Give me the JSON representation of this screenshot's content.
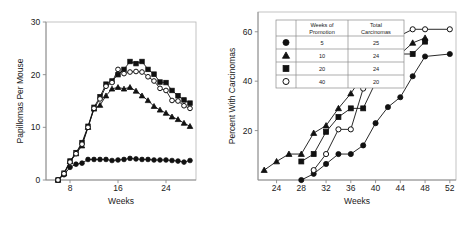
{
  "figure": {
    "background": "#ffffff",
    "ink_color": "#111111",
    "axis_color": "#8a8a8a"
  },
  "chart_data": [
    {
      "id": "papillomas-chart",
      "type": "line",
      "title": "",
      "xlabel": "Weeks",
      "ylabel": "Papillomas Per Mouse",
      "xlim": [
        4,
        29
      ],
      "ylim": [
        0,
        30
      ],
      "xticks": [
        8,
        16,
        24
      ],
      "xtick_labels": [
        "8",
        "16",
        "24"
      ],
      "yticks": [
        0,
        10,
        20,
        30
      ],
      "ytick_labels": [
        "0",
        "10",
        "20",
        "30"
      ],
      "grid": false,
      "legend_position": "none",
      "series": [
        {
          "name": "5",
          "marker": "filled-circle",
          "x": [
            6,
            7,
            8,
            9,
            10,
            11,
            12,
            13,
            14,
            15,
            16,
            17,
            18,
            19,
            20,
            21,
            22,
            23,
            24,
            25,
            26,
            27,
            28
          ],
          "y": [
            0,
            1.0,
            2.4,
            3.0,
            3.2,
            3.9,
            3.9,
            3.9,
            3.9,
            3.7,
            3.8,
            3.9,
            4.1,
            4.0,
            3.9,
            3.9,
            3.8,
            3.8,
            3.8,
            3.7,
            3.6,
            3.4,
            3.7
          ]
        },
        {
          "name": "10",
          "marker": "filled-triangle",
          "x": [
            6,
            7,
            8,
            9,
            10,
            11,
            12,
            13,
            14,
            15,
            16,
            17,
            18,
            19,
            20,
            21,
            22,
            23,
            24,
            25,
            26,
            27,
            28
          ],
          "y": [
            0,
            1.2,
            3.5,
            5.0,
            6.5,
            10.0,
            13.5,
            14.2,
            16.0,
            17.3,
            17.6,
            17.3,
            17.6,
            16.9,
            16.0,
            15.1,
            14.0,
            13.3,
            12.7,
            12.0,
            11.5,
            10.8,
            10.2
          ]
        },
        {
          "name": "20",
          "marker": "filled-square",
          "x": [
            6,
            7,
            8,
            9,
            10,
            11,
            12,
            13,
            14,
            15,
            16,
            17,
            18,
            19,
            20,
            21,
            22,
            23,
            24,
            25,
            26,
            27,
            28
          ],
          "y": [
            0,
            1.3,
            3.6,
            5.2,
            7.1,
            10.2,
            13.8,
            15.8,
            18.2,
            18.8,
            20.0,
            21.0,
            22.5,
            22.1,
            22.5,
            21.0,
            20.1,
            18.6,
            18.5,
            17.0,
            16.0,
            15.2,
            14.6
          ]
        },
        {
          "name": "40",
          "marker": "open-circle",
          "x": [
            6,
            7,
            8,
            9,
            10,
            11,
            12,
            13,
            14,
            15,
            16,
            17,
            18,
            19,
            20,
            21,
            22,
            23,
            24,
            25,
            26,
            27,
            28
          ],
          "y": [
            0,
            1.2,
            3.4,
            5.0,
            6.8,
            10.0,
            13.6,
            15.4,
            17.8,
            18.5,
            21.0,
            20.2,
            20.5,
            20.6,
            20.5,
            19.6,
            18.8,
            17.4,
            17.0,
            15.1,
            15.0,
            14.1,
            13.6
          ]
        }
      ]
    },
    {
      "id": "carcinomas-chart",
      "type": "line",
      "title": "",
      "xlabel": "Weeks",
      "ylabel": "Percent With Carcinomas",
      "xlim": [
        21,
        53
      ],
      "ylim": [
        0,
        68
      ],
      "xticks": [
        24,
        28,
        32,
        36,
        40,
        44,
        48,
        52
      ],
      "xtick_labels": [
        "24",
        "28",
        "32",
        "36",
        "40",
        "44",
        "48",
        "52"
      ],
      "yticks": [
        20,
        40,
        60
      ],
      "ytick_labels": [
        "20",
        "40",
        "60"
      ],
      "grid": false,
      "legend_position": "upper-left",
      "series": [
        {
          "name": "5",
          "marker": "filled-circle",
          "x": [
            28,
            30,
            32,
            34,
            36,
            38,
            40,
            42,
            44,
            46,
            48,
            52
          ],
          "y": [
            0,
            2.5,
            6.5,
            10.5,
            10.5,
            14.0,
            23.0,
            29.5,
            33.5,
            42.0,
            50.0,
            51.0
          ]
        },
        {
          "name": "10",
          "marker": "filled-triangle",
          "x": [
            22,
            24,
            26,
            28,
            30,
            32,
            34,
            36,
            38,
            40,
            42,
            44,
            46,
            48
          ],
          "y": [
            4.0,
            7.5,
            10.5,
            10.5,
            19.0,
            22.0,
            29.0,
            35.0,
            42.5,
            45.5,
            51.0,
            51.0,
            55.5,
            57.5
          ]
        },
        {
          "name": "20",
          "marker": "filled-square",
          "x": [
            28,
            30,
            32,
            34,
            36,
            38,
            40,
            44,
            46,
            48
          ],
          "y": [
            7.5,
            10.5,
            19.5,
            25.5,
            29.0,
            29.0,
            39.5,
            51.0,
            51.0,
            56.0
          ]
        },
        {
          "name": "40",
          "marker": "open-circle",
          "x": [
            30,
            32,
            34,
            36,
            38,
            40,
            42,
            44,
            46,
            48,
            52
          ],
          "y": [
            4.0,
            10.5,
            20.5,
            20.5,
            37.0,
            45.5,
            58.5,
            58.5,
            61.0,
            61.0,
            61.0
          ]
        }
      ],
      "legend_table": {
        "headers": [
          "",
          "Weeks of Promotion",
          "Total Carcinomas"
        ],
        "header_line1": [
          "Weeks of",
          "Total"
        ],
        "header_line2": [
          "Promotion",
          "Carcinomas"
        ],
        "rows": [
          {
            "marker": "filled-circle",
            "weeks_of_promotion": "5",
            "total_carcinomas": "25"
          },
          {
            "marker": "filled-triangle",
            "weeks_of_promotion": "10",
            "total_carcinomas": "24"
          },
          {
            "marker": "filled-square",
            "weeks_of_promotion": "20",
            "total_carcinomas": "24"
          },
          {
            "marker": "open-circle",
            "weeks_of_promotion": "40",
            "total_carcinomas": "20"
          }
        ]
      }
    }
  ]
}
